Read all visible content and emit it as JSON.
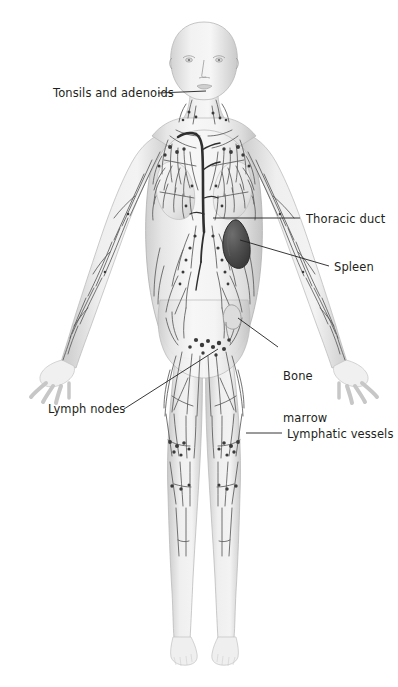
{
  "illustration": {
    "title": "Lymphatic system of the human female body",
    "subject": "female anatomical figure, anterior view",
    "background_color": "#ffffff",
    "line_color": "#231f20",
    "body_fill": "#f2f2f2",
    "body_shade": "#c9c9c9",
    "vessel_color": "#5b5b5b",
    "node_color": "#3a3a3a",
    "organ_dark_color": "#4a4a4a"
  },
  "labels": [
    {
      "id": "tonsils-and-adenoids",
      "text": "Tonsils and adenoids",
      "side": "left",
      "lines": [
        "Tonsils and adenoids"
      ],
      "text_x": 53,
      "text_y": 86,
      "leader": {
        "x1": 158,
        "y1": 93,
        "x2": 206,
        "y2": 91
      }
    },
    {
      "id": "thoracic-duct",
      "text": "Thoracic duct",
      "side": "right",
      "lines": [
        "Thoracic duct"
      ],
      "text_x": 306,
      "text_y": 212,
      "leader": {
        "x1": 300,
        "y1": 218,
        "x2": 213,
        "y2": 218
      }
    },
    {
      "id": "spleen",
      "text": "Spleen",
      "side": "right",
      "lines": [
        "Spleen"
      ],
      "text_x": 334,
      "text_y": 260,
      "leader": {
        "x1": 329,
        "y1": 266,
        "x2": 240,
        "y2": 240
      }
    },
    {
      "id": "bone-marrow",
      "text": "Bone marrow",
      "side": "right",
      "lines": [
        "Bone",
        "marrow"
      ],
      "text_x": 283,
      "text_y": 341,
      "leader": {
        "x1": 278,
        "y1": 347,
        "x2": 238,
        "y2": 318
      }
    },
    {
      "id": "lymph-nodes",
      "text": "Lymph nodes",
      "side": "left",
      "lines": [
        "Lymph nodes"
      ],
      "text_x": 48,
      "text_y": 402,
      "leader": {
        "x1": 124,
        "y1": 409,
        "x2": 218,
        "y2": 349
      }
    },
    {
      "id": "lymphatic-vessels",
      "text": "Lymphatic vessels",
      "side": "right",
      "lines": [
        "Lymphatic vessels"
      ],
      "text_x": 287,
      "text_y": 427,
      "leader": {
        "x1": 282,
        "y1": 433,
        "x2": 246,
        "y2": 433
      }
    }
  ],
  "anatomy_parts": [
    {
      "id": "head",
      "name": "head"
    },
    {
      "id": "neck",
      "name": "neck"
    },
    {
      "id": "torso",
      "name": "torso"
    },
    {
      "id": "left-arm",
      "name": "left arm"
    },
    {
      "id": "right-arm",
      "name": "right arm"
    },
    {
      "id": "left-leg",
      "name": "left leg"
    },
    {
      "id": "right-leg",
      "name": "right leg"
    },
    {
      "id": "spleen-organ",
      "name": "spleen"
    },
    {
      "id": "thoracic-duct-vessel",
      "name": "thoracic duct"
    },
    {
      "id": "cervical-nodes",
      "name": "cervical lymph nodes"
    },
    {
      "id": "axillary-nodes",
      "name": "axillary lymph nodes"
    },
    {
      "id": "inguinal-nodes",
      "name": "inguinal lymph nodes"
    },
    {
      "id": "popliteal-nodes",
      "name": "popliteal lymph nodes"
    }
  ]
}
